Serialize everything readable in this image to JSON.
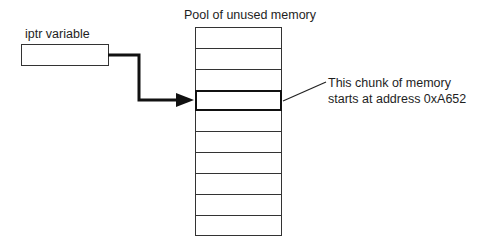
{
  "diagram": {
    "pool": {
      "title": "Pool of unused memory",
      "row_count": 10,
      "highlighted_row_index": 3
    },
    "variable": {
      "label": "iptr variable"
    },
    "callout": {
      "line1": "This chunk of memory",
      "line2": "starts at address 0xA652"
    },
    "colors": {
      "stroke": "#333333",
      "arrow": "#111111",
      "background": "#ffffff"
    }
  }
}
